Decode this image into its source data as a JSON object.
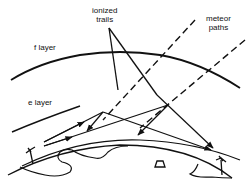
{
  "diagram": {
    "labels": {
      "ionized_trails_line1": "ionized",
      "ionized_trails_line2": "trails",
      "meteor_paths_line1": "meteor",
      "meteor_paths_line2": "paths",
      "f_layer": "f layer",
      "e_layer": "e layer"
    },
    "elements": [
      "f-layer-curve",
      "e-layer-curve",
      "meteor-path-1",
      "meteor-path-2",
      "ionized-trail-pointer-1",
      "ionized-trail-pointer-2",
      "radio-ray-up-1",
      "radio-ray-up-2",
      "radio-ray-down-1",
      "radio-ray-down-2",
      "earth-surface",
      "antenna-left",
      "antenna-right"
    ],
    "colors": {
      "ink": "#111111",
      "background": "#ffffff"
    }
  }
}
